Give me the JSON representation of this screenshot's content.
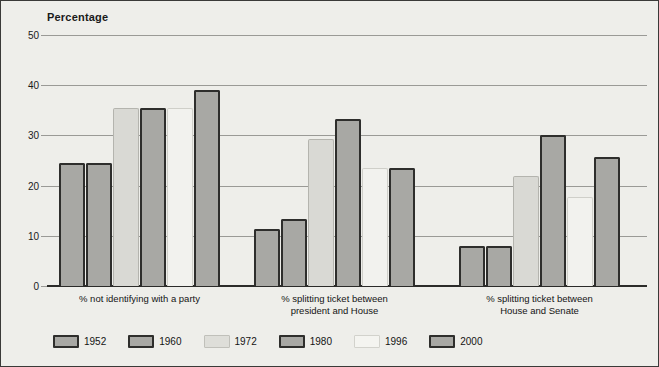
{
  "chart_data": {
    "type": "bar",
    "title": "Percentage",
    "xlabel": "",
    "ylabel": "Percentage",
    "ylim": [
      0,
      50
    ],
    "yticks": [
      0,
      10,
      20,
      30,
      40,
      50
    ],
    "grid": true,
    "legend_position": "bottom",
    "categories": [
      "% not identifying with a party",
      "% splitting ticket between president and House",
      "% splitting ticket between House and Senate"
    ],
    "category_lines": [
      [
        "% not identifying with a party"
      ],
      [
        "% splitting ticket between",
        "president and House"
      ],
      [
        "% splitting ticket between",
        "House and Senate"
      ]
    ],
    "series": [
      {
        "name": "1952",
        "tone": "tone-mid",
        "values": [
          24.5,
          11.3,
          8.0
        ]
      },
      {
        "name": "1960",
        "tone": "tone-mid",
        "values": [
          24.5,
          13.3,
          8.0
        ]
      },
      {
        "name": "1972",
        "tone": "tone-light",
        "values": [
          35.5,
          29.3,
          22.0
        ]
      },
      {
        "name": "1980",
        "tone": "tone-mid",
        "values": [
          35.5,
          33.3,
          30.0
        ]
      },
      {
        "name": "1996",
        "tone": "tone-pale",
        "values": [
          35.5,
          23.6,
          17.8
        ]
      },
      {
        "name": "2000",
        "tone": "tone-mid",
        "values": [
          23.8,
          23.6,
          25.7
        ]
      }
    ],
    "series_overrides": {
      "note": "group1 2000 bar reaches 39",
      "group1_2000": 39.0
    },
    "colors": {
      "background": "#eeeeea",
      "frame": "#3a3a38",
      "gridline": "#9a9a96",
      "axis": "#2b2b29",
      "bar_mid_fill": "#a8a8a4",
      "bar_mid_border": "#2e2e2c",
      "bar_light_fill": "#d9d9d4",
      "bar_light_border": "#b4b4ae",
      "bar_pale_fill": "#f2f2ee",
      "bar_pale_border": "#cfcfc9",
      "text": "#141414"
    }
  },
  "legend": {
    "items": [
      {
        "label": "1952",
        "tone": "tone-mid"
      },
      {
        "label": "1960",
        "tone": "tone-mid"
      },
      {
        "label": "1972",
        "tone": "tone-light"
      },
      {
        "label": "1980",
        "tone": "tone-mid"
      },
      {
        "label": "1996",
        "tone": "tone-pale"
      },
      {
        "label": "2000",
        "tone": "tone-mid"
      }
    ]
  }
}
